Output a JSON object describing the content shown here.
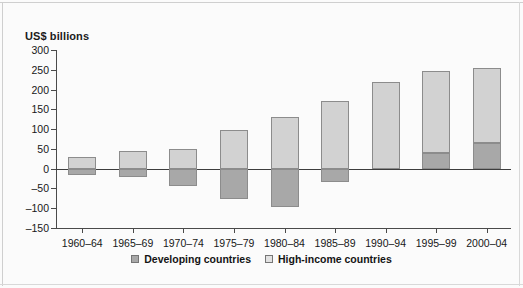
{
  "chart_data": {
    "type": "bar",
    "title": "",
    "subtitle": "",
    "xlabel": "",
    "ylabel": "US$ billions",
    "ylim": [
      -150,
      300
    ],
    "yticks": [
      300,
      250,
      200,
      150,
      100,
      50,
      0,
      -50,
      -100,
      -150
    ],
    "ytick_labels": [
      "300",
      "250",
      "200",
      "150",
      "100",
      "50",
      "0",
      "–50",
      "–100",
      "–150"
    ],
    "grid": false,
    "stacked": true,
    "legend_position": "bottom-center",
    "zero_line": 0,
    "categories": [
      "1960–64",
      "1965–69",
      "1970–74",
      "1975–79",
      "1980–84",
      "1985–89",
      "1990–94",
      "1995–99",
      "2000–04"
    ],
    "series": [
      {
        "name": "Developing countries",
        "color": "#a8a8a8",
        "values": [
          -15,
          -20,
          -45,
          -77,
          -98,
          -33,
          0,
          40,
          65
        ]
      },
      {
        "name": "High-income countries",
        "color": "#d2d2d2",
        "values": [
          30,
          45,
          50,
          97,
          130,
          172,
          218,
          248,
          255
        ]
      }
    ],
    "segments": [
      {
        "category": "1960–64",
        "high_income": {
          "from": 0,
          "to": 30
        },
        "developing": {
          "from": -15,
          "to": 0
        }
      },
      {
        "category": "1965–69",
        "high_income": {
          "from": 0,
          "to": 45
        },
        "developing": {
          "from": -20,
          "to": 0
        }
      },
      {
        "category": "1970–74",
        "high_income": {
          "from": 0,
          "to": 50
        },
        "developing": {
          "from": -45,
          "to": 0
        }
      },
      {
        "category": "1975–79",
        "high_income": {
          "from": 0,
          "to": 97
        },
        "developing": {
          "from": -77,
          "to": 0
        }
      },
      {
        "category": "1980–84",
        "high_income": {
          "from": 0,
          "to": 130
        },
        "developing": {
          "from": -98,
          "to": 0
        }
      },
      {
        "category": "1985–89",
        "high_income": {
          "from": 0,
          "to": 172
        },
        "developing": {
          "from": -33,
          "to": 0
        }
      },
      {
        "category": "1990–94",
        "high_income": {
          "from": 0,
          "to": 218
        },
        "developing": null
      },
      {
        "category": "1995–99",
        "high_income": {
          "from": 40,
          "to": 248
        },
        "developing": {
          "from": 0,
          "to": 40
        }
      },
      {
        "category": "2000–04",
        "high_income": {
          "from": 65,
          "to": 255
        },
        "developing": {
          "from": 0,
          "to": 65
        }
      }
    ]
  },
  "axis": {
    "y_title": "US$ billions"
  },
  "legend": {
    "items": [
      {
        "label": "Developing countries",
        "swatch": "dev"
      },
      {
        "label": "High-income countries",
        "swatch": "high"
      }
    ]
  }
}
